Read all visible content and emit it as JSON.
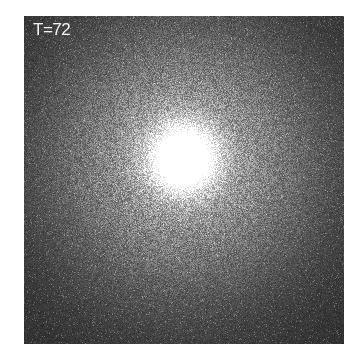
{
  "figure": {
    "label": "T=72",
    "frame": {
      "x": 24,
      "y": 16,
      "width": 320,
      "height": 328
    },
    "background_color": "#262626",
    "label_color": "#f2f2f2",
    "glow": {
      "center_x": 159,
      "center_y": 142,
      "core_radius": 22,
      "halo_radius": 95,
      "peak_color": "#ffffff"
    }
  }
}
